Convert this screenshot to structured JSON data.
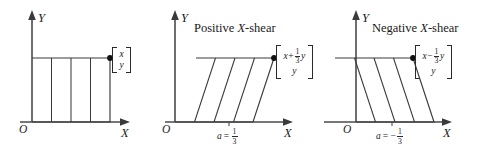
{
  "figure": {
    "colors": {
      "background": "#ffffff",
      "axis": "#4a4a4a",
      "shape_stroke": "#3a3a3a",
      "text": "#1a1a1a",
      "vertex_dot": "#111111"
    }
  },
  "panels": [
    {
      "id": "identity",
      "title": "",
      "title_prefix": "",
      "title_italic": "",
      "title_suffix": "",
      "axis_x_label": "X",
      "axis_y_label": "Y",
      "origin_label": "O",
      "shape": "rectangle",
      "shear_label": "",
      "shear_value": "",
      "vector": {
        "top_row": "x",
        "bottom_row": "y",
        "top_base": "x",
        "top_operator": "",
        "top_fraction_num": "",
        "top_fraction_den": "",
        "top_fraction_var": ""
      }
    },
    {
      "id": "positive",
      "title": "Positive X-shear",
      "title_prefix": "Positive ",
      "title_italic": "X",
      "title_suffix": "-shear",
      "axis_x_label": "X",
      "axis_y_label": "Y",
      "origin_label": "O",
      "shape": "parallelogram-right",
      "shear_label": "a",
      "shear_equals": "=",
      "shear_sign": "",
      "shear_num": "1",
      "shear_den": "3",
      "vector": {
        "top_row": "x+⅓y",
        "bottom_row": "y",
        "top_base": "x",
        "top_operator": "+",
        "top_fraction_num": "1",
        "top_fraction_den": "3",
        "top_fraction_var": "y"
      }
    },
    {
      "id": "negative",
      "title": "Negative X-shear",
      "title_prefix": "Negative ",
      "title_italic": "X",
      "title_suffix": "-shear",
      "axis_x_label": "X",
      "axis_y_label": "Y",
      "origin_label": "O",
      "shape": "parallelogram-left",
      "shear_label": "a",
      "shear_equals": "=",
      "shear_sign": "−",
      "shear_num": "1",
      "shear_den": "3",
      "vector": {
        "top_row": "x−⅓y",
        "bottom_row": "y",
        "top_base": "x",
        "top_operator": "−",
        "top_fraction_num": "1",
        "top_fraction_den": "3",
        "top_fraction_var": "y"
      }
    }
  ]
}
